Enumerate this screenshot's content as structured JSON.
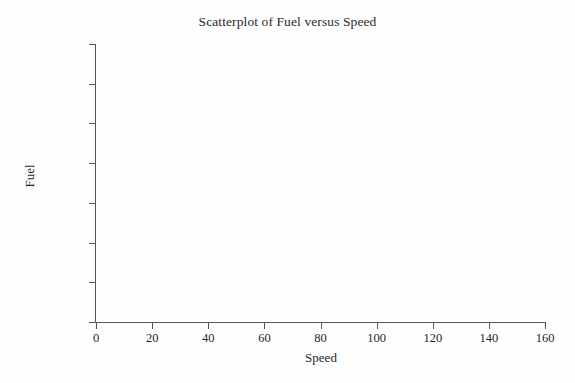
{
  "chart_data": {
    "type": "scatter",
    "title": "Scatterplot of Fuel versus Speed",
    "xlabel": "Speed",
    "ylabel": "Fuel",
    "xlim": [
      0,
      160
    ],
    "ylim": [
      5.0,
      22.5
    ],
    "xticks": [
      0,
      20,
      40,
      60,
      80,
      100,
      120,
      140,
      160
    ],
    "xtick_labels": [
      "0",
      "20",
      "40",
      "60",
      "80",
      "100",
      "120",
      "140",
      "160"
    ],
    "yticks": [
      5.0,
      7.5,
      10.0,
      12.5,
      15.0,
      17.5,
      20.0,
      22.5
    ],
    "ytick_labels": [
      "5.0",
      "7.5",
      "10.0",
      "12.5",
      "15.0",
      "17.5",
      "20.0",
      "22.5"
    ],
    "grid": false,
    "legend": false,
    "series": [
      {
        "name": "Fuel versus Speed",
        "points": []
      }
    ],
    "note": "Empty plot frame - axes drawn with no data points plotted"
  },
  "axis_color": "#555555",
  "text_color": "#262626",
  "background": "#fefefe"
}
